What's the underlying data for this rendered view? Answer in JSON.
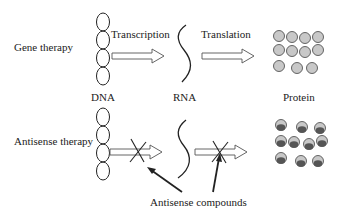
{
  "rows": {
    "gene": {
      "label": "Gene therapy"
    },
    "antisense": {
      "label": "Antisense therapy"
    }
  },
  "steps": {
    "transcription": "Transcription",
    "translation": "Translation"
  },
  "molecules": {
    "dna": "DNA",
    "rna": "RNA",
    "protein": "Protein"
  },
  "annotation": "Antisense compounds",
  "colors": {
    "stroke": "#222222",
    "protein_fill": "#c8c8c8",
    "protein_inner": "#555555"
  }
}
